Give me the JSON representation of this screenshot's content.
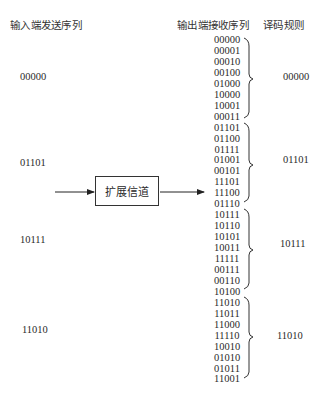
{
  "headers": {
    "input": "输入端发送序列",
    "output": "输出端接收序列",
    "decode": "译码规则"
  },
  "channel": {
    "label": "扩展信道"
  },
  "input_sequences": [
    "00000",
    "01101",
    "10111",
    "11010"
  ],
  "received_sequences": [
    "00000",
    "00001",
    "00010",
    "00100",
    "01000",
    "10000",
    "10001",
    "00011",
    "01101",
    "01100",
    "01111",
    "01001",
    "00101",
    "11101",
    "11100",
    "01110",
    "10111",
    "10110",
    "10101",
    "10011",
    "11111",
    "00111",
    "00110",
    "10100",
    "11010",
    "11011",
    "11000",
    "11110",
    "10010",
    "01010",
    "01011",
    "11001"
  ],
  "decoding_rule": [
    "00000",
    "01101",
    "10111",
    "11010"
  ]
}
